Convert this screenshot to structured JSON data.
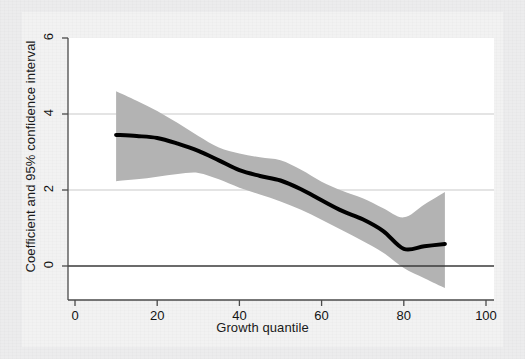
{
  "figure": {
    "background_color": "#f2f2f2",
    "page_color": "#ececed",
    "plot_background_color": "#ffffff"
  },
  "chart_data": {
    "type": "line",
    "title": "",
    "subtitle": "",
    "xlabel": "Growth quantile",
    "ylabel": "Coefficient and 95% confidence interval",
    "xlim": [
      0,
      100
    ],
    "ylim": [
      -1,
      6.4
    ],
    "xticks": [
      0,
      20,
      40,
      60,
      80,
      100
    ],
    "xtick_labels": [
      "0",
      "20",
      "40",
      "60",
      "80",
      "100"
    ],
    "yticks": [
      0,
      2,
      4,
      6
    ],
    "ytick_labels": [
      "0",
      "2",
      "4",
      "6"
    ],
    "grid": "horizontal",
    "gridlines_at": [
      2,
      4
    ],
    "zero_reference_line": 0,
    "legend": "none",
    "legend_position": "none",
    "series": [
      {
        "name": "Coefficient",
        "kind": "line",
        "color": "#000000",
        "x": [
          10,
          15,
          20,
          25,
          30,
          35,
          40,
          45,
          50,
          55,
          60,
          65,
          70,
          75,
          80,
          85,
          90
        ],
        "values": [
          3.45,
          3.42,
          3.37,
          3.22,
          3.03,
          2.78,
          2.52,
          2.37,
          2.25,
          2.02,
          1.73,
          1.45,
          1.23,
          0.92,
          0.45,
          0.52,
          0.58
        ]
      },
      {
        "name": "95% confidence interval upper",
        "kind": "band-upper",
        "color": "#b3b3b3",
        "x": [
          10,
          15,
          20,
          25,
          30,
          35,
          40,
          45,
          50,
          55,
          60,
          65,
          70,
          75,
          80,
          85,
          90
        ],
        "values": [
          4.6,
          4.35,
          4.08,
          3.76,
          3.42,
          3.12,
          2.96,
          2.86,
          2.78,
          2.53,
          2.22,
          1.98,
          1.78,
          1.52,
          1.28,
          1.62,
          1.95
        ]
      },
      {
        "name": "95% confidence interval lower",
        "kind": "band-lower",
        "color": "#b3b3b3",
        "x": [
          10,
          15,
          20,
          25,
          30,
          35,
          40,
          45,
          50,
          55,
          60,
          65,
          70,
          75,
          80,
          85,
          90
        ],
        "values": [
          2.23,
          2.28,
          2.35,
          2.42,
          2.45,
          2.28,
          2.06,
          1.88,
          1.7,
          1.48,
          1.22,
          0.94,
          0.66,
          0.35,
          -0.05,
          -0.32,
          -0.58
        ]
      }
    ]
  }
}
